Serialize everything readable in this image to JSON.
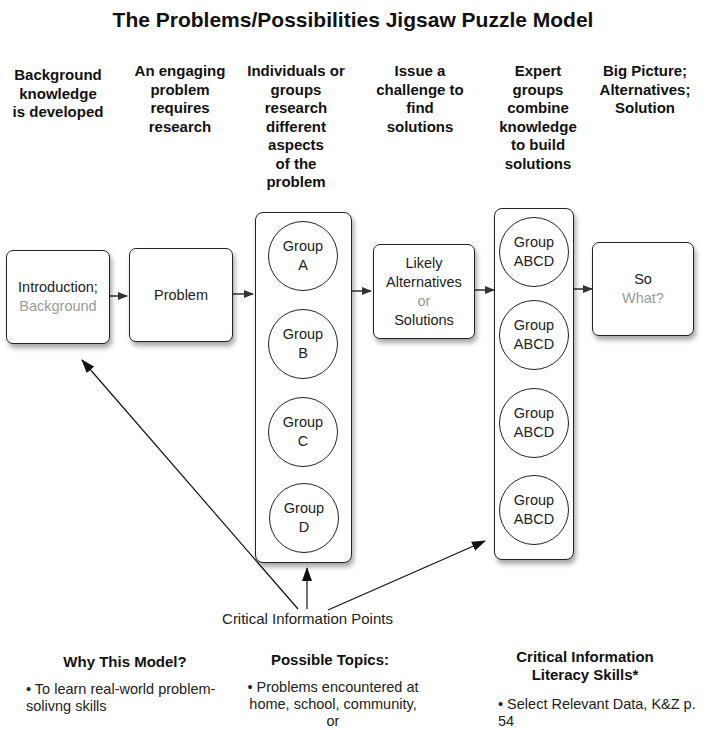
{
  "title": "The Problems/Possibilities Jigsaw Puzzle Model",
  "steps": [
    {
      "caption": [
        "Background",
        "knowledge",
        "is developed"
      ]
    },
    {
      "caption": [
        "An engaging",
        "problem",
        "requires",
        "research"
      ]
    },
    {
      "caption": [
        "Individuals or",
        "groups",
        "research",
        "different",
        "aspects",
        "of the",
        "problem"
      ]
    },
    {
      "caption": [
        "Issue a",
        "challenge to",
        "find",
        "solutions"
      ]
    },
    {
      "caption": [
        "Expert",
        "groups",
        "combine",
        "knowledge",
        "to build",
        "solutions"
      ]
    },
    {
      "caption": [
        "Big Picture;",
        "Alternatives;",
        "Solution"
      ]
    }
  ],
  "boxes": {
    "intro": {
      "line1": "Introduction;",
      "line2": "Background"
    },
    "problem": {
      "line1": "Problem"
    },
    "alternatives": {
      "line1": "Likely",
      "line2": "Alternatives",
      "line3": "or",
      "line4": "Solutions"
    },
    "so_what": {
      "line1": "So",
      "line2": "What?"
    }
  },
  "research_groups": [
    {
      "line1": "Group",
      "line2": "A"
    },
    {
      "line1": "Group",
      "line2": "B"
    },
    {
      "line1": "Group",
      "line2": "C"
    },
    {
      "line1": "Group",
      "line2": "D"
    }
  ],
  "expert_groups": [
    {
      "line1": "Group",
      "line2": "ABCD"
    },
    {
      "line1": "Group",
      "line2": "ABCD"
    },
    {
      "line1": "Group",
      "line2": "ABCD"
    },
    {
      "line1": "Group",
      "line2": "ABCD"
    }
  ],
  "critical_points_label": "Critical Information Points",
  "sections": {
    "why": {
      "heading": "Why This Model?",
      "line1": "• To learn real-world problem-",
      "line2": "solivng skills"
    },
    "topics": {
      "heading": "Possible Topics:",
      "line1": "• Problems encountered at",
      "line2": "home, school, community, or"
    },
    "skills": {
      "heading1": "Critical Information",
      "heading2": "Literacy Skills*",
      "line1": "• Select Relevant Data, K&Z p. 54"
    }
  }
}
